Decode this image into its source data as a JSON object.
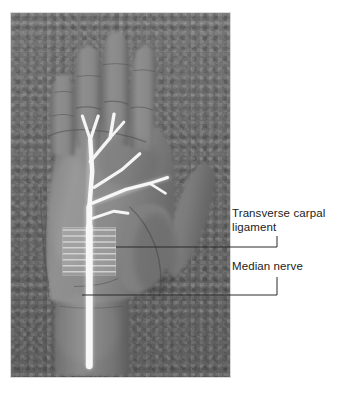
{
  "figure": {
    "kind": "anatomical-photograph",
    "modality": "black-and-white photograph with white painted nerve overlay",
    "background_tone": "#6d6d6d",
    "skin_tone_light": "#9a9a9a",
    "skin_tone_mid": "#848484",
    "skin_tone_shadow": "#5d5d5d",
    "overlay_color": "#f4f4f4",
    "photo_border_color": "#d8d8d8"
  },
  "labels": {
    "transverse_carpal_ligament": "Transverse carpal\nligament",
    "median_nerve": "Median nerve"
  },
  "annotation": {
    "leader_color": "#2b2b2b",
    "leader_width": 1,
    "tcl_leader": {
      "text_anchor_x": 277,
      "text_anchor_y": 236,
      "corner_x": 277,
      "corner_y": 247,
      "target_x": 116,
      "target_y": 247
    },
    "mn_leader": {
      "text_anchor_x": 277,
      "text_anchor_y": 277,
      "corner_x": 277,
      "corner_y": 295,
      "target_x": 82,
      "target_y": 295
    }
  },
  "overlay": {
    "description": "White-painted median nerve: wrist trunk, carpal tunnel segment crossed by the hatched transverse carpal ligament, then palmar digital branches to thumb, index, middle and ring fingers",
    "nerve_trunk": {
      "top_y": 228,
      "bottom_y": 368,
      "x": 88,
      "width": 7
    },
    "ligament_patch": {
      "left": 62,
      "top": 228,
      "width": 54,
      "height": 49,
      "hatch_line_count": 9,
      "hatch_orientation": "horizontal",
      "hatch_color": "#c9c9c9"
    },
    "branch_count": 5,
    "branch_targets": [
      "thumb",
      "index-finger",
      "middle-finger",
      "ring-finger",
      "palm-radial"
    ]
  },
  "canvas": {
    "width": 340,
    "height": 393,
    "page_background": "#ffffff"
  }
}
